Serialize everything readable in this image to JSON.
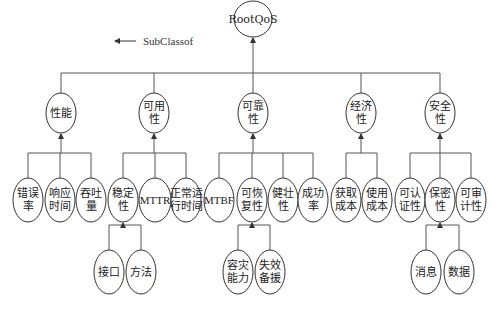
{
  "legend": {
    "label": "SubClassof",
    "arrow": "left-arrow"
  },
  "diagram": {
    "root": {
      "id": "root",
      "lines": [
        "RootQoS"
      ],
      "x": 253,
      "y": 19,
      "rx": 19,
      "ry": 18
    },
    "level1": [
      {
        "id": "performance",
        "lines": [
          "性能"
        ],
        "x": 61,
        "y": 113,
        "rx": 15,
        "ry": 20
      },
      {
        "id": "availability",
        "lines": [
          "可用",
          "性"
        ],
        "x": 154,
        "y": 113,
        "rx": 15,
        "ry": 20
      },
      {
        "id": "reliability",
        "lines": [
          "可靠",
          "性"
        ],
        "x": 253,
        "y": 113,
        "rx": 15,
        "ry": 20
      },
      {
        "id": "economy",
        "lines": [
          "经济",
          "性"
        ],
        "x": 361,
        "y": 113,
        "rx": 15,
        "ry": 20
      },
      {
        "id": "security",
        "lines": [
          "安全",
          "性"
        ],
        "x": 440,
        "y": 113,
        "rx": 15,
        "ry": 20
      }
    ],
    "level2": [
      {
        "id": "error-rate",
        "parent": "performance",
        "lines": [
          "错误",
          "率"
        ],
        "x": 28,
        "y": 200,
        "rx": 15,
        "ry": 22
      },
      {
        "id": "response-time",
        "parent": "performance",
        "lines": [
          "响应",
          "时间"
        ],
        "x": 60,
        "y": 200,
        "rx": 15,
        "ry": 22
      },
      {
        "id": "throughput",
        "parent": "performance",
        "lines": [
          "吞吐",
          "量"
        ],
        "x": 91,
        "y": 200,
        "rx": 15,
        "ry": 22
      },
      {
        "id": "stability",
        "parent": "availability",
        "lines": [
          "稳定",
          "性"
        ],
        "x": 123,
        "y": 200,
        "rx": 15,
        "ry": 22
      },
      {
        "id": "mttr",
        "parent": "availability",
        "lines": [
          "MTTR"
        ],
        "x": 155,
        "y": 200,
        "rx": 16,
        "ry": 22,
        "latin": true
      },
      {
        "id": "normal-uptime",
        "parent": "availability",
        "lines": [
          "正常运",
          "行时间"
        ],
        "x": 186,
        "y": 200,
        "rx": 15,
        "ry": 22
      },
      {
        "id": "mtbf",
        "parent": "reliability",
        "lines": [
          "MTBF"
        ],
        "x": 219,
        "y": 200,
        "rx": 15,
        "ry": 22,
        "latin": true
      },
      {
        "id": "recoverability",
        "parent": "reliability",
        "lines": [
          "可恢",
          "复性"
        ],
        "x": 252,
        "y": 200,
        "rx": 15,
        "ry": 22
      },
      {
        "id": "robustness",
        "parent": "reliability",
        "lines": [
          "健壮",
          "性"
        ],
        "x": 283,
        "y": 200,
        "rx": 15,
        "ry": 22
      },
      {
        "id": "success-rate",
        "parent": "reliability",
        "lines": [
          "成功",
          "率"
        ],
        "x": 313,
        "y": 200,
        "rx": 15,
        "ry": 22
      },
      {
        "id": "acquisition-cost",
        "parent": "economy",
        "lines": [
          "获取",
          "成本"
        ],
        "x": 346,
        "y": 200,
        "rx": 15,
        "ry": 22
      },
      {
        "id": "usage-cost",
        "parent": "economy",
        "lines": [
          "使用",
          "成本"
        ],
        "x": 377,
        "y": 200,
        "rx": 15,
        "ry": 22
      },
      {
        "id": "authenticability",
        "parent": "security",
        "lines": [
          "可认",
          "证性"
        ],
        "x": 410,
        "y": 200,
        "rx": 15,
        "ry": 22
      },
      {
        "id": "confidentiality",
        "parent": "security",
        "lines": [
          "保密",
          "性"
        ],
        "x": 440,
        "y": 200,
        "rx": 15,
        "ry": 22
      },
      {
        "id": "auditability",
        "parent": "security",
        "lines": [
          "可审",
          "计性"
        ],
        "x": 471,
        "y": 200,
        "rx": 15,
        "ry": 22
      }
    ],
    "level3": [
      {
        "id": "interface",
        "parent": "stability",
        "lines": [
          "接口"
        ],
        "x": 109,
        "y": 272,
        "rx": 15,
        "ry": 22
      },
      {
        "id": "method",
        "parent": "stability",
        "lines": [
          "方法"
        ],
        "x": 141,
        "y": 272,
        "rx": 15,
        "ry": 22
      },
      {
        "id": "disaster-tolerance",
        "parent": "recoverability",
        "lines": [
          "容灾",
          "能力"
        ],
        "x": 238,
        "y": 272,
        "rx": 15,
        "ry": 22
      },
      {
        "id": "failover",
        "parent": "recoverability",
        "lines": [
          "失效",
          "备援"
        ],
        "x": 270,
        "y": 272,
        "rx": 15,
        "ry": 22
      },
      {
        "id": "message",
        "parent": "confidentiality",
        "lines": [
          "消息"
        ],
        "x": 426,
        "y": 272,
        "rx": 15,
        "ry": 22
      },
      {
        "id": "data",
        "parent": "confidentiality",
        "lines": [
          "数据"
        ],
        "x": 459,
        "y": 272,
        "rx": 15,
        "ry": 22
      }
    ]
  }
}
